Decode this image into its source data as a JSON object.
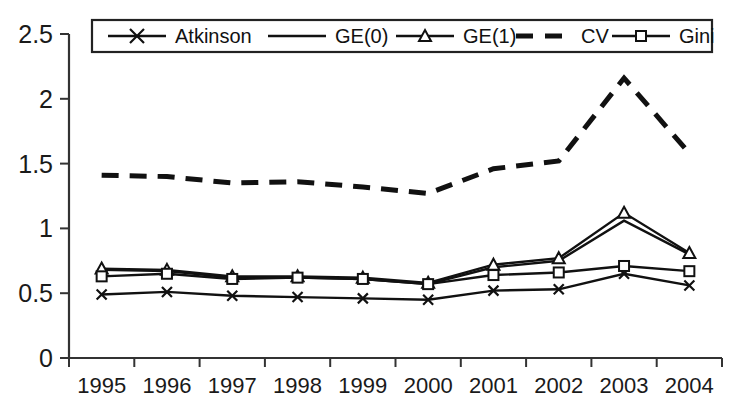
{
  "chart_data": {
    "type": "line",
    "title": "",
    "xlabel": "",
    "ylabel": "",
    "grid": false,
    "legend_position": "top-inside",
    "ylim": [
      0,
      2.5
    ],
    "y_ticks": [
      "0",
      "0.5",
      "1",
      "1.5",
      "2",
      "2.5"
    ],
    "y_tick_values": [
      0,
      0.5,
      1,
      1.5,
      2,
      2.5
    ],
    "categories": [
      "1995",
      "1996",
      "1997",
      "1998",
      "1999",
      "2000",
      "2001",
      "2002",
      "2003",
      "2004"
    ],
    "x": [
      1995,
      1996,
      1997,
      1998,
      1999,
      2000,
      2001,
      2002,
      2003,
      2004
    ],
    "series": [
      {
        "name": "Atkinson",
        "marker": "x",
        "dash": "solid",
        "values": [
          0.49,
          0.51,
          0.48,
          0.47,
          0.46,
          0.45,
          0.52,
          0.53,
          0.65,
          0.56
        ]
      },
      {
        "name": "GE(0)",
        "marker": "none",
        "dash": "solid",
        "values": [
          0.68,
          0.67,
          0.62,
          0.62,
          0.61,
          0.57,
          0.7,
          0.75,
          1.06,
          0.8
        ]
      },
      {
        "name": "GE(1)",
        "marker": "triangle",
        "dash": "solid",
        "values": [
          0.69,
          0.68,
          0.63,
          0.63,
          0.62,
          0.58,
          0.72,
          0.77,
          1.12,
          0.81
        ]
      },
      {
        "name": "CV",
        "marker": "none",
        "dash": "dashed",
        "values": [
          1.41,
          1.4,
          1.35,
          1.36,
          1.32,
          1.27,
          1.46,
          1.52,
          2.16,
          1.58
        ]
      },
      {
        "name": "Gini",
        "marker": "square",
        "dash": "solid",
        "values": [
          0.63,
          0.65,
          0.61,
          0.62,
          0.61,
          0.57,
          0.64,
          0.66,
          0.71,
          0.67
        ]
      }
    ]
  },
  "legend": {
    "items": [
      {
        "label": "Atkinson",
        "marker": "x",
        "dash": "solid"
      },
      {
        "label": "GE(0)",
        "marker": "none",
        "dash": "solid"
      },
      {
        "label": "GE(1)",
        "marker": "triangle",
        "dash": "solid"
      },
      {
        "label": "CV",
        "marker": "none",
        "dash": "dashed"
      },
      {
        "label": "Gini",
        "marker": "square",
        "dash": "solid"
      }
    ]
  },
  "colors": {
    "line": "#111111",
    "axis": "#333333",
    "background": "#ffffff",
    "text": "#1a1a1a"
  },
  "y_axis": {
    "labels": [
      "2.5",
      "2",
      "1.5",
      "1",
      "0.5",
      "0"
    ]
  },
  "x_axis": {
    "labels": [
      "1995",
      "1996",
      "1997",
      "1998",
      "1999",
      "2000",
      "2001",
      "2002",
      "2003",
      "2004"
    ]
  }
}
